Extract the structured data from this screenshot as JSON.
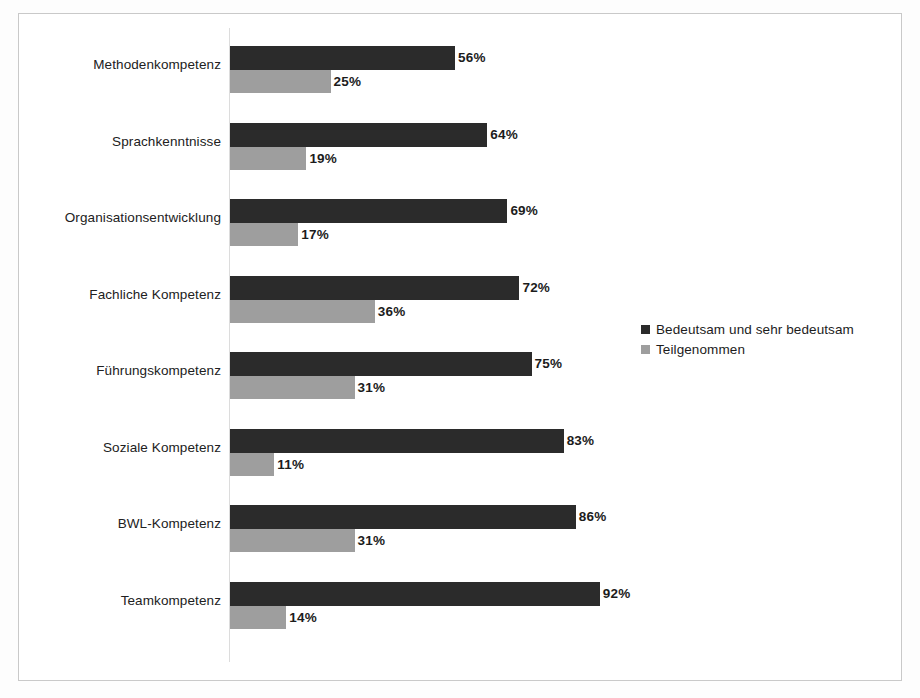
{
  "chart_data": {
    "type": "bar",
    "orientation": "horizontal",
    "title": "",
    "xlabel": "",
    "ylabel": "",
    "xlim": [
      0,
      100
    ],
    "grid": false,
    "legend_position": "right",
    "value_suffix": "%",
    "categories": [
      "Methodenkompetenz",
      "Sprachkenntnisse",
      "Organisationsentwicklung",
      "Fachliche Kompetenz",
      "Führungskompetenz",
      "Soziale Kompetenz",
      "BWL-Kompetenz",
      "Teamkompetenz"
    ],
    "series": [
      {
        "name": "Bedeutsam und sehr bedeutsam",
        "color": "#2b2b2b",
        "values": [
          56,
          64,
          69,
          72,
          75,
          83,
          86,
          92
        ],
        "labels": [
          "56%",
          "64%",
          "69%",
          "72%",
          "75%",
          "83%",
          "86%",
          "92%"
        ]
      },
      {
        "name": "Teilgenommen",
        "color": "#9e9e9e",
        "values": [
          25,
          19,
          17,
          36,
          31,
          11,
          31,
          14
        ],
        "labels": [
          "25%",
          "19%",
          "17%",
          "36%",
          "31%",
          "11%",
          "31%",
          "14%"
        ]
      }
    ]
  },
  "legend": {
    "items": [
      {
        "label": "Bedeutsam und sehr bedeutsam",
        "color": "#2b2b2b"
      },
      {
        "label": "Teilgenommen",
        "color": "#9e9e9e"
      }
    ]
  }
}
